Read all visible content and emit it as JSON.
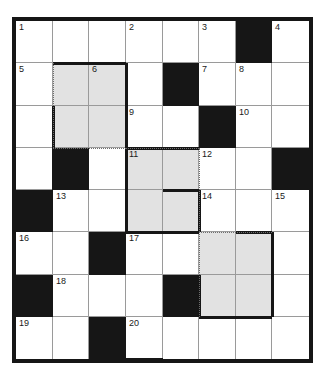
{
  "puzzle": {
    "type": "crossword-grid",
    "rows": 8,
    "columns": 8,
    "colors": {
      "background": "#ffffff",
      "block": "#161616",
      "shaded": "#e2e2e2",
      "thin_rule": "#9a9a9a",
      "number_text": "#1a1a1a"
    },
    "cells": [
      [
        {
          "state": "open",
          "number": "1"
        },
        {
          "state": "open",
          "number": ""
        },
        {
          "state": "open",
          "number": ""
        },
        {
          "state": "open",
          "number": "2"
        },
        {
          "state": "open",
          "number": ""
        },
        {
          "state": "open",
          "number": "3"
        },
        {
          "state": "block",
          "number": ""
        },
        {
          "state": "open",
          "number": "4"
        }
      ],
      [
        {
          "state": "open",
          "number": "5"
        },
        {
          "state": "shaded",
          "number": ""
        },
        {
          "state": "shaded",
          "number": "6"
        },
        {
          "state": "open",
          "number": ""
        },
        {
          "state": "block",
          "number": ""
        },
        {
          "state": "open",
          "number": "7"
        },
        {
          "state": "open",
          "number": "8"
        },
        {
          "state": "open",
          "number": ""
        }
      ],
      [
        {
          "state": "open",
          "number": ""
        },
        {
          "state": "shaded",
          "number": ""
        },
        {
          "state": "shaded",
          "number": ""
        },
        {
          "state": "open",
          "number": "9"
        },
        {
          "state": "open",
          "number": ""
        },
        {
          "state": "block",
          "number": ""
        },
        {
          "state": "open",
          "number": "10"
        },
        {
          "state": "open",
          "number": ""
        }
      ],
      [
        {
          "state": "open",
          "number": ""
        },
        {
          "state": "block",
          "number": ""
        },
        {
          "state": "open",
          "number": ""
        },
        {
          "state": "shaded",
          "number": "11"
        },
        {
          "state": "shaded",
          "number": ""
        },
        {
          "state": "open",
          "number": "12"
        },
        {
          "state": "open",
          "number": ""
        },
        {
          "state": "block",
          "number": ""
        }
      ],
      [
        {
          "state": "block",
          "number": ""
        },
        {
          "state": "open",
          "number": "13"
        },
        {
          "state": "open",
          "number": ""
        },
        {
          "state": "shaded",
          "number": ""
        },
        {
          "state": "shaded",
          "number": ""
        },
        {
          "state": "open",
          "number": "14"
        },
        {
          "state": "open",
          "number": ""
        },
        {
          "state": "open",
          "number": "15"
        }
      ],
      [
        {
          "state": "open",
          "number": "16"
        },
        {
          "state": "open",
          "number": ""
        },
        {
          "state": "block",
          "number": ""
        },
        {
          "state": "open",
          "number": "17"
        },
        {
          "state": "open",
          "number": ""
        },
        {
          "state": "shaded",
          "number": ""
        },
        {
          "state": "shaded",
          "number": ""
        },
        {
          "state": "open",
          "number": ""
        }
      ],
      [
        {
          "state": "block",
          "number": ""
        },
        {
          "state": "open",
          "number": "18"
        },
        {
          "state": "open",
          "number": ""
        },
        {
          "state": "open",
          "number": ""
        },
        {
          "state": "block",
          "number": ""
        },
        {
          "state": "shaded",
          "number": ""
        },
        {
          "state": "shaded",
          "number": ""
        },
        {
          "state": "open",
          "number": ""
        }
      ],
      [
        {
          "state": "open",
          "number": "19"
        },
        {
          "state": "open",
          "number": ""
        },
        {
          "state": "block",
          "number": ""
        },
        {
          "state": "open",
          "number": "20"
        },
        {
          "state": "open",
          "number": ""
        },
        {
          "state": "open",
          "number": ""
        },
        {
          "state": "open",
          "number": ""
        },
        {
          "state": "open",
          "number": ""
        }
      ]
    ],
    "shaded_regions": [
      {
        "label": "6",
        "start_row": 2,
        "start_col": 2,
        "end_row": 3,
        "end_col": 3
      },
      {
        "label": "11",
        "start_row": 4,
        "start_col": 4,
        "end_row": 5,
        "end_col": 5
      },
      {
        "label": "17-block",
        "start_row": 6,
        "start_col": 6,
        "end_row": 7,
        "end_col": 7
      }
    ]
  }
}
